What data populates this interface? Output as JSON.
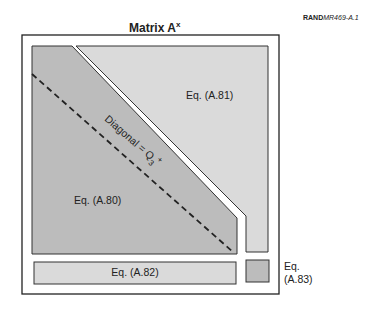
{
  "header": {
    "ref_bold": "RAND",
    "ref_italic": "MR469-A.1"
  },
  "title": {
    "text": "Matrix A",
    "superscript": "x"
  },
  "regions": {
    "lower": {
      "label": "Eq. (A.80)",
      "fill": "#bcbcbc"
    },
    "upper": {
      "label": "Eq. (A.81)",
      "fill": "#dadada"
    },
    "bottom_bar": {
      "label": "Eq. (A.82)",
      "fill": "#dadada"
    },
    "corner": {
      "label_line1": "Eq.",
      "label_line2": "(A.83)",
      "fill": "#bcbcbc"
    }
  },
  "diagonal": {
    "label_main": "Diagonal = Q",
    "label_sub": "3",
    "label_sup": "+"
  },
  "colors": {
    "stroke": "#333333",
    "frame": "#222222",
    "background": "#ffffff"
  }
}
